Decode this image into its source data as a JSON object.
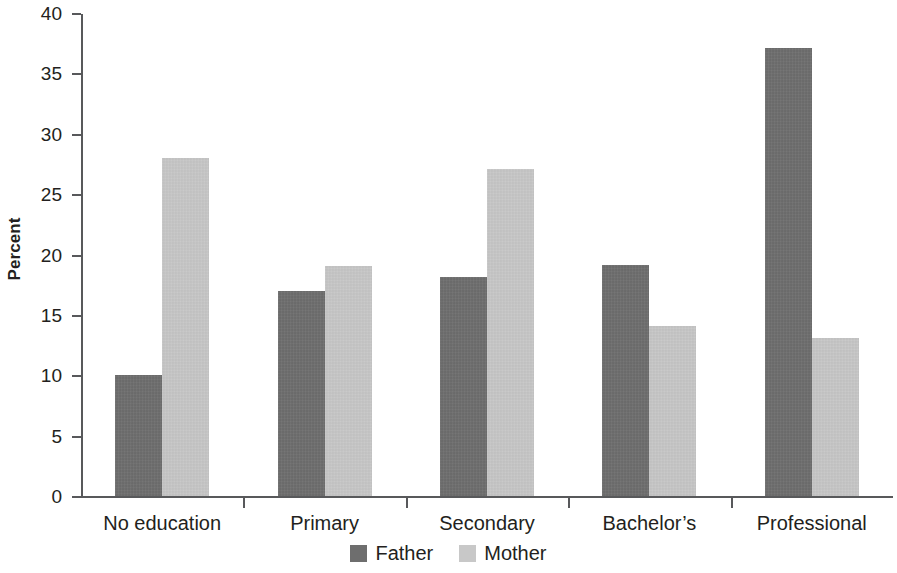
{
  "chart_data": {
    "type": "bar",
    "title": "",
    "xlabel": "",
    "ylabel": "Percent",
    "ylim": [
      0,
      40
    ],
    "yticks": [
      0,
      5,
      10,
      15,
      20,
      25,
      30,
      35,
      40
    ],
    "ytick_labels": [
      "0",
      "5",
      "10",
      "15",
      "20",
      "25",
      "30",
      "35",
      "40"
    ],
    "grid": false,
    "legend_position": "bottom-center",
    "categories": [
      "No education",
      "Primary",
      "Secondary",
      "Bachelor’s",
      "Professional"
    ],
    "series": [
      {
        "name": "Father",
        "color": "#6e6e6e",
        "values": [
          10.1,
          17.1,
          18.2,
          19.2,
          37.2
        ]
      },
      {
        "name": "Mother",
        "color": "#c8c8c8",
        "values": [
          28.1,
          19.1,
          27.2,
          14.2,
          13.2
        ]
      }
    ]
  },
  "axis": {
    "y_title": "Percent",
    "axis_color": "#58595b"
  },
  "legend": {
    "items": [
      {
        "label": "Father",
        "swatch": "father"
      },
      {
        "label": "Mother",
        "swatch": "mother"
      }
    ]
  }
}
